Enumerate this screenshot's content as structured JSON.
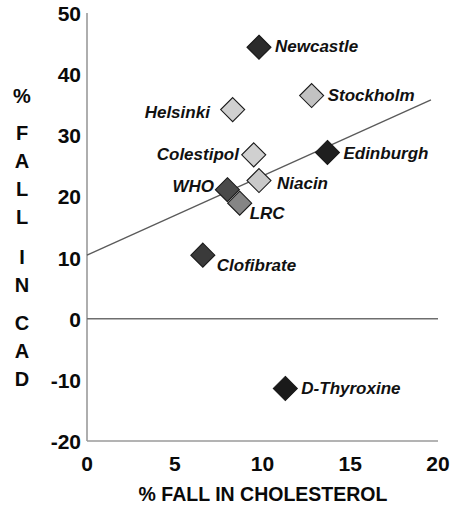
{
  "chart_data": {
    "type": "scatter",
    "title": "",
    "xlabel": "% FALL IN CHOLESTEROL",
    "ylabel": "% FALL IN CAD",
    "ylabel_chars": [
      "%",
      "F",
      "A",
      "L",
      "L",
      "I",
      "N",
      "C",
      "A",
      "D"
    ],
    "xlim": [
      0,
      20
    ],
    "ylim": [
      -20,
      50
    ],
    "xticks": [
      "0",
      "5",
      "10",
      "15",
      "20"
    ],
    "xtick_values": [
      0,
      5,
      10,
      15,
      20
    ],
    "yticks": [
      "50",
      "40",
      "30",
      "20",
      "10",
      "0",
      "-10",
      "-20"
    ],
    "ytick_values": [
      50,
      40,
      30,
      20,
      10,
      0,
      -10,
      -20
    ],
    "grid": false,
    "legend": "none",
    "zero_line": true,
    "trendline": {
      "name": "regression-line",
      "x0": 0,
      "y0": 10.4,
      "x1": 19.6,
      "y1": 35.8
    },
    "points": [
      {
        "label": "Newcastle",
        "x": 9.8,
        "y": 44.4,
        "fill": "#2b2b2b",
        "label_dx": 16,
        "label_dy": 5
      },
      {
        "label": "Stockholm",
        "x": 12.8,
        "y": 36.5,
        "fill": "#c2c2c2",
        "label_dx": 16,
        "label_dy": 5
      },
      {
        "label": "Helsinki",
        "x": 8.3,
        "y": 34.2,
        "fill": "#d0d0d0",
        "label_dx": -88,
        "label_dy": 8
      },
      {
        "label": "Colestipol",
        "x": 9.5,
        "y": 26.8,
        "fill": "#d0d0d0",
        "label_dx": -97,
        "label_dy": 5
      },
      {
        "label": "Edinburgh",
        "x": 13.7,
        "y": 27.2,
        "fill": "#1f1f1f",
        "label_dx": 16,
        "label_dy": 7
      },
      {
        "label": "Niacin",
        "x": 9.8,
        "y": 22.6,
        "fill": "#c9c9c9",
        "label_dx": 18,
        "label_dy": 8
      },
      {
        "label": "WHO",
        "x": 8.0,
        "y": 21.1,
        "fill": "#4a4a4a",
        "label_dx": -55,
        "label_dy": 2
      },
      {
        "label": "LRC",
        "x": 8.7,
        "y": 18.9,
        "fill": "#858585",
        "label_dx": 10,
        "label_dy": 16
      },
      {
        "label": "Clofibrate",
        "x": 6.6,
        "y": 10.4,
        "fill": "#3a3a3a",
        "label_dx": 14,
        "label_dy": 16
      },
      {
        "label": "D-Thyroxine",
        "x": 11.3,
        "y": -11.4,
        "fill": "#1a1a1a",
        "label_dx": 16,
        "label_dy": 6
      }
    ]
  },
  "colors": {
    "axis": "#9a9a9a",
    "text": "#0a0a0a",
    "trend": "#5a5a5a",
    "background": "#ffffff"
  }
}
